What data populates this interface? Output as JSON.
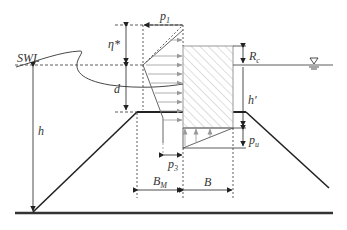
{
  "diagram": {
    "labels": {
      "swl": "SWL",
      "p1": "p",
      "p1_sub": "1",
      "eta": "η*",
      "d": "d",
      "h": "h",
      "rc": "R",
      "rc_sub": "c",
      "h_prime": "h′",
      "pu": "p",
      "pu_sub": "u",
      "p3": "p",
      "p3_sub": "3",
      "bm": "B",
      "bm_sub": "M",
      "b": "B"
    },
    "colors": {
      "line": "#222222",
      "dim_line": "#333333",
      "arrow": "#888888",
      "hatch": "#bbbbbb",
      "seabed": "#333333"
    }
  }
}
